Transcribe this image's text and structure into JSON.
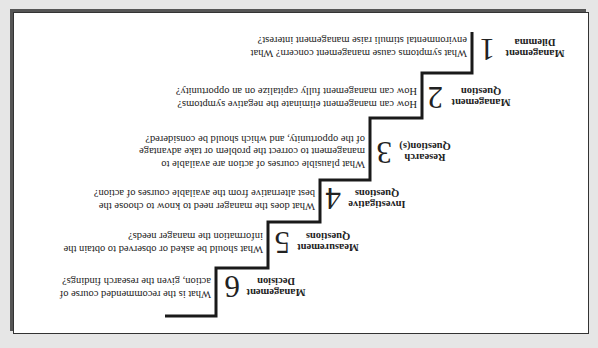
{
  "figure": {
    "orientation": "rotated 180 degrees",
    "steps": [
      {
        "number": "1",
        "label_line1": "Management",
        "label_line2": "Dilemma",
        "question_lines": [
          "What symptoms cause management concern? What",
          "environmental stimuli raise management interest?"
        ]
      },
      {
        "number": "2",
        "label_line1": "Management",
        "label_line2": "Question",
        "question_lines": [
          "How can management eliminate the negative symptoms?",
          "How can management fully capitalize on an opportunity?"
        ]
      },
      {
        "number": "3",
        "label_line1": "Research",
        "label_line2": "Question(s)",
        "question_lines": [
          "What plausible courses of action are available to",
          "management to correct the problem or take advantage",
          "of the opportunity, and which should be considered?"
        ]
      },
      {
        "number": "4",
        "label_line1": "Investigative",
        "label_line2": "Questions",
        "question_lines": [
          "What does the manager need to know to choose the",
          "best alternative from the available courses of action?"
        ]
      },
      {
        "number": "5",
        "label_line1": "Measurement",
        "label_line2": "Questions",
        "question_lines": [
          "What should be asked or observed to obtain the",
          "information the manager needs?"
        ]
      },
      {
        "number": "6",
        "label_line1": "Management",
        "label_line2": "Decision",
        "question_lines": [
          "What is the recommended course of",
          "action, given the research findings?"
        ]
      }
    ]
  }
}
